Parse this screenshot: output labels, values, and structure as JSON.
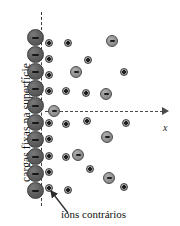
{
  "figure": {
    "labels": {
      "surface_charges": "cargas  fixas na superfície",
      "counter_ions": "íons contrários",
      "x_axis": "x"
    },
    "colors": {
      "surface_charge_fill": "#606060",
      "anion_fill": "#949494",
      "cation_fill": "#9c9c9c",
      "line": "#4a4a4a",
      "background": "#ffffff"
    },
    "icons": {
      "surface_charge": "minus-circle-icon",
      "anion": "minus-circle-icon",
      "cation": "plus-circle-icon",
      "axis_arrow": "arrow-right-icon",
      "pointer": "leader-arrow-icon"
    },
    "geometry": {
      "surface_line_x": 41,
      "surface_line_y0": 12,
      "surface_line_y1": 206,
      "axis_y": 111,
      "axis_x0": 45,
      "axis_x1": 168
    },
    "surface_charges": [
      {
        "x": 27,
        "y": 29
      },
      {
        "x": 27,
        "y": 46
      },
      {
        "x": 27,
        "y": 63
      },
      {
        "x": 27,
        "y": 80
      },
      {
        "x": 27,
        "y": 97
      },
      {
        "x": 27,
        "y": 114
      },
      {
        "x": 27,
        "y": 131
      },
      {
        "x": 27,
        "y": 148
      },
      {
        "x": 27,
        "y": 165
      },
      {
        "x": 27,
        "y": 182
      }
    ],
    "anions": [
      {
        "x": 106,
        "y": 35
      },
      {
        "x": 70,
        "y": 66
      },
      {
        "x": 100,
        "y": 88
      },
      {
        "x": 48,
        "y": 105
      },
      {
        "x": 101,
        "y": 131
      },
      {
        "x": 72,
        "y": 149
      },
      {
        "x": 103,
        "y": 172
      }
    ],
    "cations": [
      {
        "x": 45,
        "y": 39
      },
      {
        "x": 64,
        "y": 39
      },
      {
        "x": 45,
        "y": 55
      },
      {
        "x": 84,
        "y": 56
      },
      {
        "x": 45,
        "y": 71
      },
      {
        "x": 120,
        "y": 68
      },
      {
        "x": 45,
        "y": 87
      },
      {
        "x": 62,
        "y": 87
      },
      {
        "x": 82,
        "y": 89
      },
      {
        "x": 45,
        "y": 119
      },
      {
        "x": 62,
        "y": 120
      },
      {
        "x": 83,
        "y": 117
      },
      {
        "x": 122,
        "y": 119
      },
      {
        "x": 45,
        "y": 135
      },
      {
        "x": 45,
        "y": 152
      },
      {
        "x": 62,
        "y": 153
      },
      {
        "x": 45,
        "y": 168
      },
      {
        "x": 86,
        "y": 165
      },
      {
        "x": 45,
        "y": 184
      },
      {
        "x": 64,
        "y": 186
      },
      {
        "x": 120,
        "y": 183
      }
    ]
  }
}
